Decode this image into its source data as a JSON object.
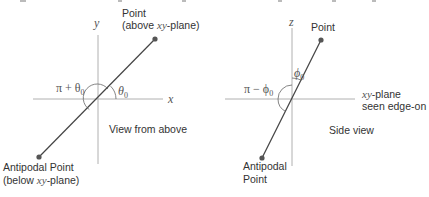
{
  "colors": {
    "axis": "#b0b0b0",
    "line": "#444444",
    "dot": "#555555",
    "text": "#333333",
    "math": "#555555"
  },
  "left_diagram": {
    "caption": "View from above",
    "axis_x_label": "x",
    "axis_y_label": "y",
    "point_label_line1": "Point",
    "point_label_line2_prefix": "(above ",
    "point_label_line2_math": "xy",
    "point_label_line2_suffix": "-plane)",
    "antipodal_label_line1": "Antipodal Point",
    "antipodal_label_line2_prefix": "(below ",
    "antipodal_label_line2_math": "xy",
    "antipodal_label_line2_suffix": "-plane)",
    "angle_label": "θ",
    "angle_sub": "0",
    "supplement_label_prefix": "π + θ",
    "supplement_sub": "0"
  },
  "right_diagram": {
    "caption": "Side view",
    "axis_z_label": "z",
    "point_label": "Point",
    "antipodal_label_line1": "Antipodal",
    "antipodal_label_line2": "Point",
    "plane_label_math": "xy",
    "plane_label_suffix": "-plane",
    "plane_label_line2": "seen edge-on",
    "angle_label": "ϕ",
    "angle_sub": "0",
    "supplement_label_prefix": "π − ϕ",
    "supplement_sub": "0"
  }
}
